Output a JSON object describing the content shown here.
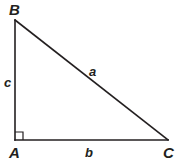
{
  "figure": {
    "type": "right-triangle-diagram",
    "canvas": {
      "width": 178,
      "height": 162
    },
    "background_color": "#ffffff",
    "stroke_color": "#231f20",
    "text_color": "#231f20",
    "vertices": [
      {
        "name": "B",
        "label": "B",
        "x": 15,
        "y": 20
      },
      {
        "name": "A",
        "label": "A",
        "x": 15,
        "y": 140
      },
      {
        "name": "C",
        "label": "C",
        "x": 168,
        "y": 140
      }
    ],
    "sides": [
      {
        "name": "a",
        "label": "a",
        "from": "B",
        "to": "C",
        "role": "hypotenuse"
      },
      {
        "name": "b",
        "label": "b",
        "from": "A",
        "to": "C",
        "role": "base-leg"
      },
      {
        "name": "c",
        "label": "c",
        "from": "A",
        "to": "B",
        "role": "vertical-leg"
      }
    ],
    "right_angle": {
      "at_vertex": "A",
      "marker": "square",
      "size": 8,
      "x": 15,
      "y": 132
    },
    "labels": {
      "vertex_B": "B",
      "vertex_A": "A",
      "vertex_C": "C",
      "side_a": "a",
      "side_b": "b",
      "side_c": "c"
    }
  }
}
